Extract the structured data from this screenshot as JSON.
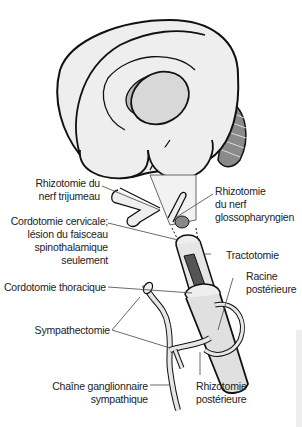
{
  "diagram": {
    "type": "anatomical-illustration",
    "colors": {
      "outline": "#111111",
      "tissue_fill": "#e8e8e8",
      "tissue_shade": "#cfcfcf",
      "cord_dark": "#555555",
      "cut_fill": "#888888",
      "leader": "#444444"
    },
    "labels": {
      "rhizotomie_trijumeau": [
        "Rhizotomie du",
        "nerf trijumeau"
      ],
      "rhizotomie_glosso": [
        "Rhizotomie",
        "du nerf",
        "glossopharyngien"
      ],
      "cordotomie_cervicale": [
        "Cordotomie cervicale;",
        "lésion du faisceau",
        "spinothalamique",
        "seulement"
      ],
      "tractotomie": [
        "Tractotomie"
      ],
      "racine_posterieure": [
        "Racine",
        "postérieure"
      ],
      "cordotomie_thoracique": [
        "Cordotomie thoracique"
      ],
      "sympathectomie": [
        "Sympathectomie"
      ],
      "chaine_ganglionnaire": [
        "Chaîne ganglionnaire",
        "sympathique"
      ],
      "rhizotomie_posterieure": [
        "Rhizotomie",
        "postérieure"
      ]
    }
  }
}
